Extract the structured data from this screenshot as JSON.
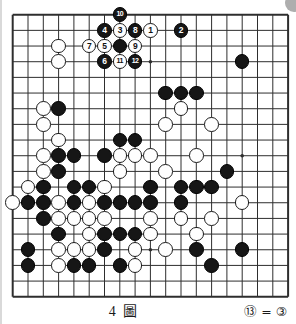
{
  "figure": {
    "caption": "4 圖",
    "note": "⑬ = ③",
    "board_size": 19
  },
  "colors": {
    "background": "#ffffff",
    "line": "#2e2e2e",
    "black_stone": "#161616",
    "white_stone": "#fefefe",
    "corner_mark": "#aeaeae"
  },
  "board": {
    "star_points": [
      [
        9,
        3
      ],
      [
        15,
        9
      ],
      [
        9,
        15
      ]
    ],
    "stones": [
      {
        "x": 7,
        "y": 0,
        "color": "black",
        "label": "10"
      },
      {
        "x": 6,
        "y": 1,
        "color": "black",
        "label": "4"
      },
      {
        "x": 7,
        "y": 1,
        "color": "white",
        "label": "3"
      },
      {
        "x": 8,
        "y": 1,
        "color": "black",
        "label": "8"
      },
      {
        "x": 9,
        "y": 1,
        "color": "white",
        "label": "1"
      },
      {
        "x": 11,
        "y": 1,
        "color": "black",
        "label": "2"
      },
      {
        "x": 5,
        "y": 2,
        "color": "white",
        "label": "7"
      },
      {
        "x": 6,
        "y": 2,
        "color": "white",
        "label": "5"
      },
      {
        "x": 7,
        "y": 2,
        "color": "black",
        "label": ""
      },
      {
        "x": 8,
        "y": 2,
        "color": "white",
        "label": "9"
      },
      {
        "x": 6,
        "y": 3,
        "color": "black",
        "label": "6"
      },
      {
        "x": 7,
        "y": 3,
        "color": "white",
        "label": "11"
      },
      {
        "x": 8,
        "y": 3,
        "color": "black",
        "label": "12"
      },
      {
        "x": 3,
        "y": 2,
        "color": "white",
        "label": ""
      },
      {
        "x": 3,
        "y": 3,
        "color": "white",
        "label": ""
      },
      {
        "x": 15,
        "y": 3,
        "color": "black",
        "label": ""
      },
      {
        "x": 10,
        "y": 5,
        "color": "black",
        "label": ""
      },
      {
        "x": 11,
        "y": 5,
        "color": "black",
        "label": ""
      },
      {
        "x": 12,
        "y": 5,
        "color": "black",
        "label": ""
      },
      {
        "x": 2,
        "y": 6,
        "color": "white",
        "label": ""
      },
      {
        "x": 3,
        "y": 6,
        "color": "black",
        "label": ""
      },
      {
        "x": 11,
        "y": 6,
        "color": "white",
        "label": ""
      },
      {
        "x": 2,
        "y": 7,
        "color": "white",
        "label": ""
      },
      {
        "x": 10,
        "y": 7,
        "color": "white",
        "label": ""
      },
      {
        "x": 13,
        "y": 7,
        "color": "white",
        "label": ""
      },
      {
        "x": 3,
        "y": 8,
        "color": "white",
        "label": ""
      },
      {
        "x": 7,
        "y": 8,
        "color": "black",
        "label": ""
      },
      {
        "x": 8,
        "y": 8,
        "color": "black",
        "label": ""
      },
      {
        "x": 2,
        "y": 9,
        "color": "white",
        "label": ""
      },
      {
        "x": 3,
        "y": 9,
        "color": "black",
        "label": ""
      },
      {
        "x": 4,
        "y": 9,
        "color": "black",
        "label": ""
      },
      {
        "x": 6,
        "y": 9,
        "color": "black",
        "label": ""
      },
      {
        "x": 7,
        "y": 9,
        "color": "white",
        "label": ""
      },
      {
        "x": 8,
        "y": 9,
        "color": "white",
        "label": ""
      },
      {
        "x": 9,
        "y": 9,
        "color": "white",
        "label": ""
      },
      {
        "x": 12,
        "y": 9,
        "color": "white",
        "label": ""
      },
      {
        "x": 2,
        "y": 10,
        "color": "white",
        "label": ""
      },
      {
        "x": 3,
        "y": 10,
        "color": "black",
        "label": ""
      },
      {
        "x": 7,
        "y": 10,
        "color": "white",
        "label": ""
      },
      {
        "x": 10,
        "y": 10,
        "color": "white",
        "label": ""
      },
      {
        "x": 14,
        "y": 10,
        "color": "black",
        "label": ""
      },
      {
        "x": 1,
        "y": 11,
        "color": "white",
        "label": ""
      },
      {
        "x": 2,
        "y": 11,
        "color": "black",
        "label": ""
      },
      {
        "x": 4,
        "y": 11,
        "color": "black",
        "label": ""
      },
      {
        "x": 5,
        "y": 11,
        "color": "black",
        "label": ""
      },
      {
        "x": 6,
        "y": 11,
        "color": "white",
        "label": ""
      },
      {
        "x": 9,
        "y": 11,
        "color": "black",
        "label": ""
      },
      {
        "x": 11,
        "y": 11,
        "color": "black",
        "label": ""
      },
      {
        "x": 12,
        "y": 11,
        "color": "black",
        "label": ""
      },
      {
        "x": 13,
        "y": 11,
        "color": "black",
        "label": ""
      },
      {
        "x": 0,
        "y": 12,
        "color": "white",
        "label": ""
      },
      {
        "x": 1,
        "y": 12,
        "color": "black",
        "label": ""
      },
      {
        "x": 2,
        "y": 12,
        "color": "black",
        "label": ""
      },
      {
        "x": 3,
        "y": 12,
        "color": "white",
        "label": ""
      },
      {
        "x": 4,
        "y": 12,
        "color": "black",
        "label": ""
      },
      {
        "x": 5,
        "y": 12,
        "color": "white",
        "label": ""
      },
      {
        "x": 6,
        "y": 12,
        "color": "black",
        "label": ""
      },
      {
        "x": 7,
        "y": 12,
        "color": "black",
        "label": ""
      },
      {
        "x": 8,
        "y": 12,
        "color": "black",
        "label": ""
      },
      {
        "x": 9,
        "y": 12,
        "color": "black",
        "label": ""
      },
      {
        "x": 11,
        "y": 12,
        "color": "black",
        "label": ""
      },
      {
        "x": 15,
        "y": 12,
        "color": "white",
        "label": ""
      },
      {
        "x": 2,
        "y": 13,
        "color": "black",
        "label": ""
      },
      {
        "x": 3,
        "y": 13,
        "color": "white",
        "label": ""
      },
      {
        "x": 4,
        "y": 13,
        "color": "white",
        "label": ""
      },
      {
        "x": 5,
        "y": 13,
        "color": "white",
        "label": ""
      },
      {
        "x": 6,
        "y": 13,
        "color": "white",
        "label": ""
      },
      {
        "x": 9,
        "y": 13,
        "color": "white",
        "label": ""
      },
      {
        "x": 11,
        "y": 13,
        "color": "white",
        "label": ""
      },
      {
        "x": 13,
        "y": 13,
        "color": "white",
        "label": ""
      },
      {
        "x": 3,
        "y": 14,
        "color": "black",
        "label": ""
      },
      {
        "x": 5,
        "y": 14,
        "color": "white",
        "label": ""
      },
      {
        "x": 6,
        "y": 14,
        "color": "black",
        "label": ""
      },
      {
        "x": 7,
        "y": 14,
        "color": "black",
        "label": ""
      },
      {
        "x": 8,
        "y": 14,
        "color": "black",
        "label": ""
      },
      {
        "x": 9,
        "y": 14,
        "color": "white",
        "label": ""
      },
      {
        "x": 12,
        "y": 14,
        "color": "white",
        "label": ""
      },
      {
        "x": 1,
        "y": 15,
        "color": "black",
        "label": ""
      },
      {
        "x": 3,
        "y": 15,
        "color": "white",
        "label": ""
      },
      {
        "x": 4,
        "y": 15,
        "color": "white",
        "label": ""
      },
      {
        "x": 5,
        "y": 15,
        "color": "white",
        "label": ""
      },
      {
        "x": 6,
        "y": 15,
        "color": "black",
        "label": ""
      },
      {
        "x": 8,
        "y": 15,
        "color": "white",
        "label": ""
      },
      {
        "x": 10,
        "y": 15,
        "color": "white",
        "label": ""
      },
      {
        "x": 12,
        "y": 15,
        "color": "black",
        "label": ""
      },
      {
        "x": 15,
        "y": 15,
        "color": "black",
        "label": ""
      },
      {
        "x": 1,
        "y": 16,
        "color": "black",
        "label": ""
      },
      {
        "x": 3,
        "y": 16,
        "color": "white",
        "label": ""
      },
      {
        "x": 4,
        "y": 16,
        "color": "black",
        "label": ""
      },
      {
        "x": 5,
        "y": 16,
        "color": "black",
        "label": ""
      },
      {
        "x": 7,
        "y": 16,
        "color": "black",
        "label": ""
      },
      {
        "x": 8,
        "y": 16,
        "color": "white",
        "label": ""
      },
      {
        "x": 13,
        "y": 16,
        "color": "black",
        "label": ""
      }
    ]
  }
}
